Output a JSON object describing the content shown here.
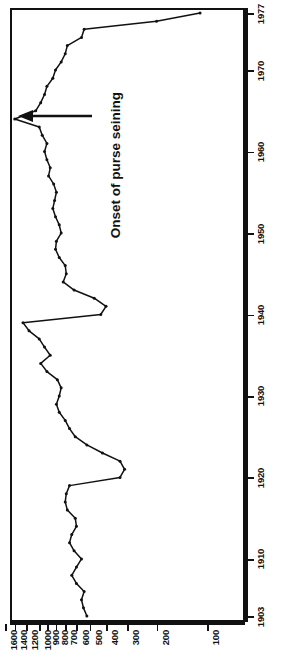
{
  "figure": {
    "orientation": "rotated-90",
    "annotation": "Onset of purse seining",
    "line_color": "#111111",
    "frame_color": "#111111"
  },
  "chart_data": {
    "type": "line",
    "title": "",
    "subtitle": "",
    "xlabel": "",
    "ylabel": "",
    "orientation": "vertical-time-axis",
    "grid": false,
    "legend": null,
    "annotations": [
      {
        "text": "Onset of purse seining",
        "points_to_year": 1964,
        "points_to_value": 1400,
        "arrow": "left"
      }
    ],
    "x": "year",
    "xlim": [
      1903,
      1977
    ],
    "xticks": [
      1903,
      1910,
      1920,
      1930,
      1940,
      1950,
      1960,
      1970,
      1977
    ],
    "xticklabels": [
      "1903",
      "1910",
      "1920",
      "1930",
      "1940",
      "1950",
      "1960",
      "1970",
      "1977"
    ],
    "yscale": "log-like",
    "ylim": [
      60,
      1700
    ],
    "yticks": [
      100,
      200,
      300,
      400,
      500,
      600,
      700,
      800,
      900,
      1000,
      1200,
      1400,
      1600
    ],
    "yticklabels": [
      "100",
      "200",
      "300",
      "400",
      "500",
      "600",
      "700",
      "800",
      "900",
      "1000",
      "1200",
      "1400",
      "1600"
    ],
    "series": [
      {
        "name": "catch",
        "marker": "dot",
        "points": [
          {
            "year": 1903,
            "value": 520
          },
          {
            "year": 1904,
            "value": 545
          },
          {
            "year": 1905,
            "value": 560
          },
          {
            "year": 1906,
            "value": 540
          },
          {
            "year": 1907,
            "value": 600
          },
          {
            "year": 1908,
            "value": 640
          },
          {
            "year": 1909,
            "value": 600
          },
          {
            "year": 1910,
            "value": 560
          },
          {
            "year": 1911,
            "value": 620
          },
          {
            "year": 1912,
            "value": 660
          },
          {
            "year": 1913,
            "value": 640
          },
          {
            "year": 1914,
            "value": 600
          },
          {
            "year": 1915,
            "value": 610
          },
          {
            "year": 1916,
            "value": 680
          },
          {
            "year": 1917,
            "value": 700
          },
          {
            "year": 1918,
            "value": 690
          },
          {
            "year": 1919,
            "value": 660
          },
          {
            "year": 1920,
            "value": 330
          },
          {
            "year": 1921,
            "value": 310
          },
          {
            "year": 1922,
            "value": 330
          },
          {
            "year": 1923,
            "value": 420
          },
          {
            "year": 1924,
            "value": 520
          },
          {
            "year": 1925,
            "value": 610
          },
          {
            "year": 1926,
            "value": 660
          },
          {
            "year": 1927,
            "value": 700
          },
          {
            "year": 1928,
            "value": 760
          },
          {
            "year": 1929,
            "value": 790
          },
          {
            "year": 1930,
            "value": 760
          },
          {
            "year": 1931,
            "value": 740
          },
          {
            "year": 1932,
            "value": 780
          },
          {
            "year": 1933,
            "value": 900
          },
          {
            "year": 1934,
            "value": 980
          },
          {
            "year": 1935,
            "value": 860
          },
          {
            "year": 1936,
            "value": 930
          },
          {
            "year": 1937,
            "value": 1000
          },
          {
            "year": 1938,
            "value": 1150
          },
          {
            "year": 1939,
            "value": 1250
          },
          {
            "year": 1940,
            "value": 430
          },
          {
            "year": 1941,
            "value": 400
          },
          {
            "year": 1942,
            "value": 470
          },
          {
            "year": 1943,
            "value": 620
          },
          {
            "year": 1944,
            "value": 720
          },
          {
            "year": 1945,
            "value": 690
          },
          {
            "year": 1946,
            "value": 700
          },
          {
            "year": 1947,
            "value": 760
          },
          {
            "year": 1948,
            "value": 800
          },
          {
            "year": 1949,
            "value": 790
          },
          {
            "year": 1950,
            "value": 740
          },
          {
            "year": 1951,
            "value": 760
          },
          {
            "year": 1952,
            "value": 800
          },
          {
            "year": 1953,
            "value": 830
          },
          {
            "year": 1954,
            "value": 810
          },
          {
            "year": 1955,
            "value": 790
          },
          {
            "year": 1956,
            "value": 820
          },
          {
            "year": 1957,
            "value": 880
          },
          {
            "year": 1958,
            "value": 860
          },
          {
            "year": 1959,
            "value": 900
          },
          {
            "year": 1960,
            "value": 930
          },
          {
            "year": 1961,
            "value": 900
          },
          {
            "year": 1962,
            "value": 960
          },
          {
            "year": 1963,
            "value": 1000
          },
          {
            "year": 1964,
            "value": 1400
          },
          {
            "year": 1965,
            "value": 1050
          },
          {
            "year": 1966,
            "value": 980
          },
          {
            "year": 1967,
            "value": 930
          },
          {
            "year": 1968,
            "value": 900
          },
          {
            "year": 1969,
            "value": 830
          },
          {
            "year": 1970,
            "value": 800
          },
          {
            "year": 1971,
            "value": 740
          },
          {
            "year": 1972,
            "value": 700
          },
          {
            "year": 1973,
            "value": 680
          },
          {
            "year": 1974,
            "value": 560
          },
          {
            "year": 1975,
            "value": 540
          },
          {
            "year": 1976,
            "value": 200
          },
          {
            "year": 1977,
            "value": 110
          }
        ]
      }
    ]
  }
}
